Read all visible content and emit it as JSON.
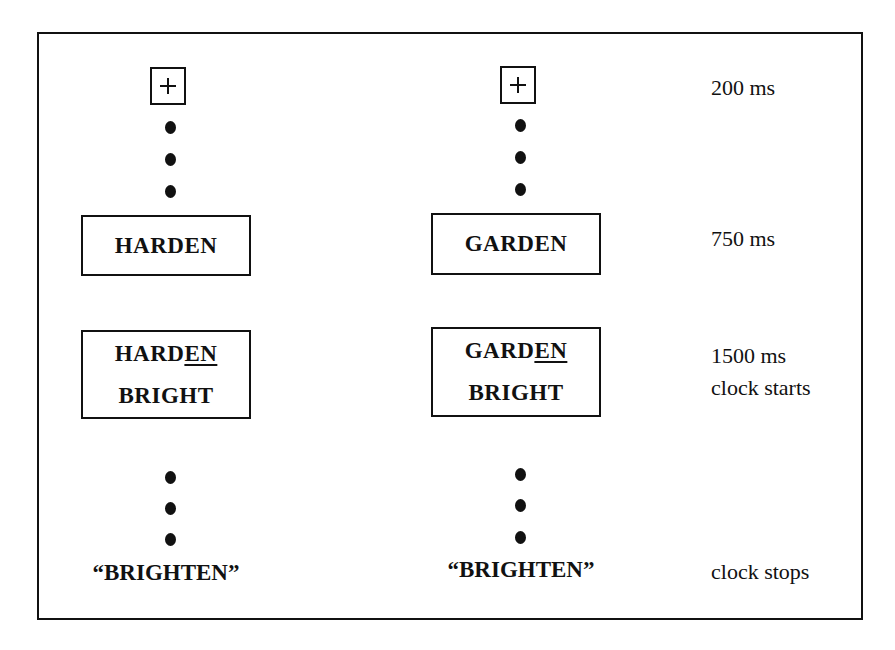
{
  "diagram": {
    "type": "experimental-trial-sequence",
    "conditions": [
      {
        "name": "related",
        "fixation": "+",
        "prime": "HARDEN",
        "target_top": {
          "plain": "HARD",
          "underlined": "EN",
          "full": "HARDEN"
        },
        "target_bottom": "BRIGHT",
        "response": "“BRIGHTEN”"
      },
      {
        "name": "control",
        "fixation": "+",
        "prime": "GARDEN",
        "target_top": {
          "plain": "GARD",
          "underlined": "EN",
          "full": "GARDEN"
        },
        "target_bottom": "BRIGHT",
        "response": "“BRIGHTEN”"
      }
    ],
    "timing_labels": {
      "fixation": "200 ms",
      "prime": "750 ms",
      "target_duration": "1500 ms",
      "target_event": "clock starts",
      "response_event": "clock stops"
    }
  }
}
